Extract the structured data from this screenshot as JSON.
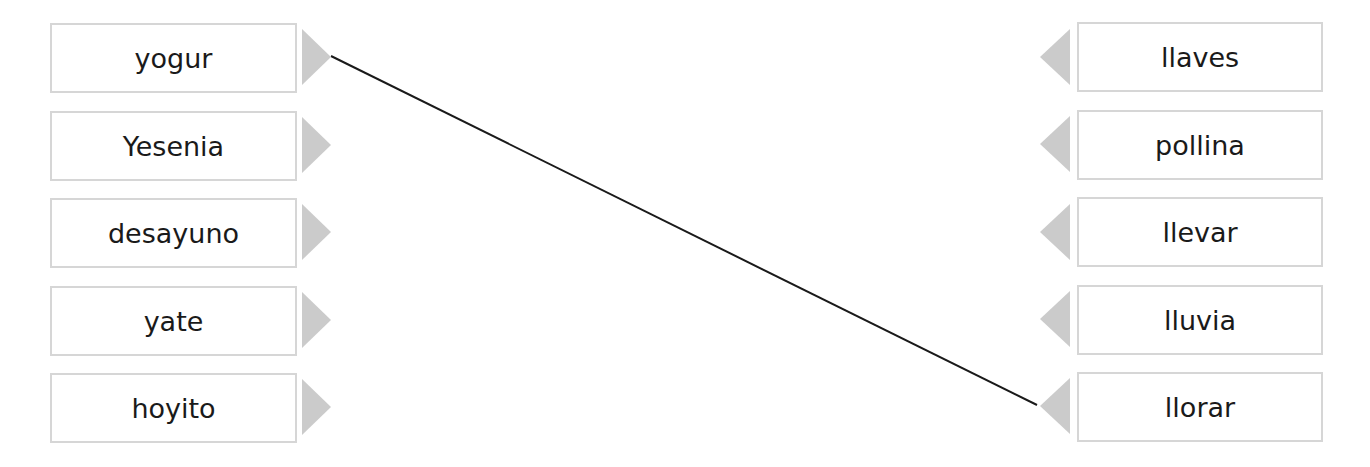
{
  "left_items": [
    {
      "label": "yogur"
    },
    {
      "label": "Yesenia"
    },
    {
      "label": "desayuno"
    },
    {
      "label": "yate"
    },
    {
      "label": "hoyito"
    }
  ],
  "right_items": [
    {
      "label": "llaves"
    },
    {
      "label": "pollina"
    },
    {
      "label": "llevar"
    },
    {
      "label": "lluvia"
    },
    {
      "label": "llorar"
    }
  ],
  "connections": [
    {
      "from": "yogur",
      "to": "llorar"
    }
  ],
  "colors": {
    "box_border": "#d6d6d6",
    "arrow": "#cbcbcb",
    "line": "#1a1a1a",
    "text": "#1a1a1a"
  }
}
